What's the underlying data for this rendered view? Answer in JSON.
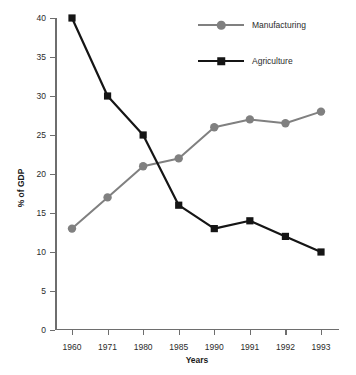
{
  "chart_data": {
    "type": "line",
    "title": "",
    "xlabel": "Years",
    "ylabel": "% of GDP",
    "categories": [
      "1960",
      "1971",
      "1980",
      "1985",
      "1990",
      "1991",
      "1992",
      "1993"
    ],
    "ylim": [
      0,
      40
    ],
    "yticks": [
      0,
      5,
      10,
      15,
      20,
      25,
      30,
      35,
      40
    ],
    "grid": false,
    "legend_position": "top-right",
    "series": [
      {
        "name": "Manufacturing",
        "color": "#808080",
        "marker": "circle",
        "values": [
          13,
          17,
          21,
          22,
          26,
          27,
          26.5,
          28
        ]
      },
      {
        "name": "Agriculture",
        "color": "#151515",
        "marker": "square",
        "values": [
          40,
          30,
          25,
          16,
          13,
          14,
          12,
          10
        ]
      }
    ]
  },
  "legend": {
    "items": [
      {
        "label": "Manufacturing"
      },
      {
        "label": "Agriculture"
      }
    ]
  },
  "axes": {
    "y_title": "% of GDP",
    "x_title": "Years"
  }
}
